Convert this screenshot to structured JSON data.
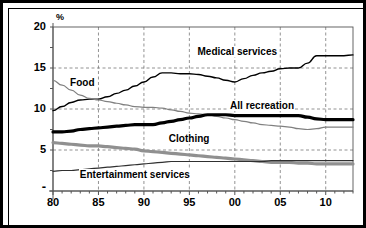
{
  "chart_data": {
    "type": "line",
    "title": "",
    "xlabel": "",
    "ylabel": "%",
    "ylim": [
      0,
      20
    ],
    "xlim": [
      1980,
      2013
    ],
    "grid": true,
    "legend_position": "inline-annotations",
    "y_ticks": [
      "20",
      "15",
      "10",
      "5",
      "-"
    ],
    "y_tick_values": [
      20,
      15,
      10,
      5,
      0
    ],
    "x_ticks": [
      "80",
      "85",
      "90",
      "95",
      "00",
      "05",
      "10"
    ],
    "x_tick_values": [
      1980,
      1985,
      1990,
      1995,
      2000,
      2005,
      2010
    ],
    "x": [
      1980,
      1981,
      1982,
      1983,
      1984,
      1985,
      1986,
      1987,
      1988,
      1989,
      1990,
      1991,
      1992,
      1993,
      1994,
      1995,
      1996,
      1997,
      1998,
      1999,
      2000,
      2001,
      2002,
      2003,
      2004,
      2005,
      2006,
      2007,
      2008,
      2009,
      2010,
      2011,
      2012,
      2013
    ],
    "series": [
      {
        "name": "Medical services",
        "color": "#000000",
        "width": 1.4,
        "values": [
          9.8,
          10.3,
          10.8,
          11.1,
          11.2,
          11.2,
          11.5,
          11.9,
          12.3,
          12.8,
          13.3,
          13.9,
          14.4,
          14.4,
          14.3,
          14.3,
          14.2,
          14.0,
          13.8,
          13.5,
          13.3,
          13.7,
          14.1,
          14.4,
          14.6,
          14.9,
          15.0,
          15.0,
          15.6,
          16.5,
          16.5,
          16.5,
          16.5,
          16.6
        ]
      },
      {
        "name": "Food",
        "color": "#808080",
        "width": 1.2,
        "values": [
          13.5,
          12.9,
          12.3,
          11.7,
          11.3,
          11.1,
          10.9,
          10.7,
          10.5,
          10.3,
          10.2,
          10.2,
          10.1,
          9.9,
          9.7,
          9.5,
          9.4,
          9.3,
          9.1,
          8.9,
          8.7,
          8.5,
          8.3,
          8.1,
          8.0,
          7.9,
          7.8,
          7.6,
          7.5,
          7.6,
          7.8,
          7.8,
          7.8,
          7.8
        ]
      },
      {
        "name": "All recreation",
        "color": "#000000",
        "width": 3.2,
        "values": [
          7.2,
          7.2,
          7.3,
          7.5,
          7.6,
          7.7,
          7.8,
          7.9,
          8.0,
          8.1,
          8.1,
          8.1,
          8.3,
          8.5,
          8.7,
          8.9,
          9.1,
          9.3,
          9.3,
          9.3,
          9.2,
          9.2,
          9.2,
          9.2,
          9.2,
          9.2,
          9.2,
          9.2,
          9.0,
          8.8,
          8.7,
          8.7,
          8.7,
          8.7
        ]
      },
      {
        "name": "Clothing",
        "color": "#909090",
        "width": 3.2,
        "values": [
          5.9,
          5.8,
          5.7,
          5.6,
          5.5,
          5.5,
          5.4,
          5.3,
          5.2,
          5.1,
          4.9,
          4.8,
          4.7,
          4.6,
          4.5,
          4.4,
          4.3,
          4.2,
          4.1,
          4.0,
          3.9,
          3.8,
          3.7,
          3.6,
          3.5,
          3.5,
          3.5,
          3.4,
          3.4,
          3.3,
          3.3,
          3.3,
          3.3,
          3.3
        ]
      },
      {
        "name": "Entertainment services",
        "color": "#303030",
        "width": 1.2,
        "values": [
          2.4,
          2.5,
          2.5,
          2.6,
          2.7,
          2.8,
          2.9,
          3.0,
          3.1,
          3.2,
          3.3,
          3.4,
          3.5,
          3.6,
          3.6,
          3.6,
          3.6,
          3.6,
          3.6,
          3.6,
          3.6,
          3.6,
          3.6,
          3.6,
          3.7,
          3.7,
          3.7,
          3.7,
          3.7,
          3.7,
          3.7,
          3.7,
          3.7,
          3.7
        ]
      }
    ],
    "annotations": [
      {
        "text": "Medical services",
        "x": 2000.3,
        "y": 17.0
      },
      {
        "text": "Food",
        "x": 1983.2,
        "y": 13.2
      },
      {
        "text": "All recreation",
        "x": 2003.0,
        "y": 10.4
      },
      {
        "text": "Clothing",
        "x": 1995.0,
        "y": 6.3
      },
      {
        "text": "Entertainment services",
        "x": 1989.0,
        "y": 1.9
      }
    ]
  }
}
